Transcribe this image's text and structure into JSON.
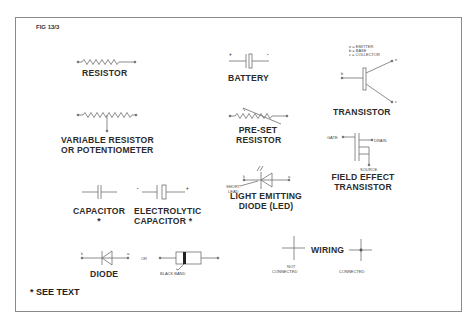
{
  "figure": {
    "id": "FIG 13/3",
    "footnote": "* SEE TEXT"
  },
  "components": {
    "resistor": {
      "label": "RESISTOR"
    },
    "battery": {
      "label": "BATTERY",
      "plus": "+",
      "minus": "-"
    },
    "transistor": {
      "label": "TRANSISTOR",
      "legend": [
        "e = EMITTER",
        "b = BASE",
        "c = COLLECTOR"
      ],
      "terminals": {
        "b": "b",
        "e": "e",
        "c": "c"
      }
    },
    "variable_resistor": {
      "label_line1": "VARIABLE RESISTOR",
      "label_line2": "OR POTENTIOMETER"
    },
    "preset_resistor": {
      "label_line1": "PRE-SET",
      "label_line2": "RESISTOR"
    },
    "fet": {
      "label_line1": "FIELD EFFECT",
      "label_line2": "TRANSISTOR",
      "gate": "GATE",
      "drain": "DRAIN",
      "source": "SOURCE"
    },
    "led": {
      "label_line1": "LIGHT EMITTING",
      "label_line2": "DIODE (LED)",
      "short_lead_line1": "SHORT",
      "short_lead_line2": "LEAD",
      "terminal_k": "k",
      "terminal_a": "a"
    },
    "capacitor": {
      "label_line1": "CAPACITOR",
      "label_line2": "*"
    },
    "electrolytic_capacitor": {
      "label_line1": "ELECTROLYTIC",
      "label_line2": "CAPACITOR *",
      "minus": "-",
      "plus": "+"
    },
    "diode": {
      "label": "DIODE",
      "or": "OR",
      "black_band": "BLACK BAND",
      "terminal_k": "k",
      "terminal_a": "a"
    },
    "wiring": {
      "title": "WIRING",
      "not_connected_line1": "NOT",
      "not_connected_line2": "CONNECTED",
      "connected": "CONNECTED"
    }
  },
  "colors": {
    "line": "#6f6f6f",
    "text": "#2b2b2b",
    "frame": "#8a8a8a"
  }
}
